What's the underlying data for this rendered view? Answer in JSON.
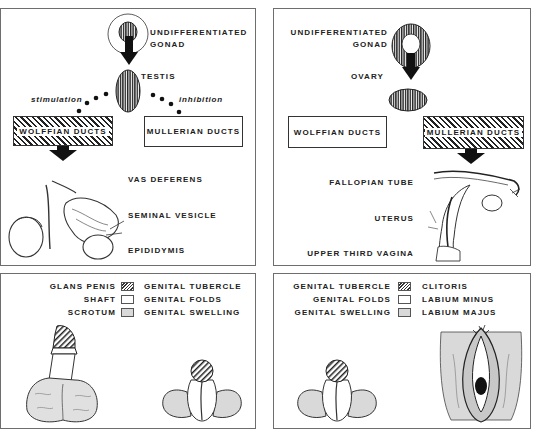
{
  "male_top": {
    "gonad_label_1": "UNDIFFERENTIATED",
    "gonad_label_2": "GONAD",
    "testis_label": "TESTIS",
    "stimulation": "stimulation",
    "inhibition": "inhibition",
    "wolffian": "WOLFFIAN DUCTS",
    "mullerian": "MULLERIAN DUCTS",
    "structures": [
      "VAS DEFERENS",
      "SEMINAL VESICLE",
      "EPIDIDYMIS"
    ]
  },
  "female_top": {
    "gonad_label_1": "UNDIFFERENTIATED",
    "gonad_label_2": "GONAD",
    "ovary_label": "OVARY",
    "wolffian": "WOLFFIAN DUCTS",
    "mullerian": "MULLERIAN DUCTS",
    "structures": [
      "FALLOPIAN TUBE",
      "UTERUS",
      "UPPER THIRD VAGINA"
    ]
  },
  "male_bottom": {
    "legend": [
      {
        "adult": "GLANS PENIS",
        "swatch": "hatched",
        "embryonic": "GENITAL TUBERCLE"
      },
      {
        "adult": "SHAFT",
        "swatch": "plain",
        "embryonic": "GENITAL FOLDS"
      },
      {
        "adult": "SCROTUM",
        "swatch": "gray",
        "embryonic": "GENITAL SWELLING"
      }
    ]
  },
  "female_bottom": {
    "legend": [
      {
        "embryonic": "GENITAL TUBERCLE",
        "swatch": "hatched",
        "adult": "CLITORIS"
      },
      {
        "embryonic": "GENITAL FOLDS",
        "swatch": "plain",
        "adult": "LABIUM MINUS"
      },
      {
        "embryonic": "GENITAL SWELLING",
        "swatch": "gray",
        "adult": "LABIUM MAJUS"
      }
    ]
  },
  "colors": {
    "ink": "#222222",
    "border": "#6e6e6e",
    "swelling_gray": "#d9d9d9"
  }
}
